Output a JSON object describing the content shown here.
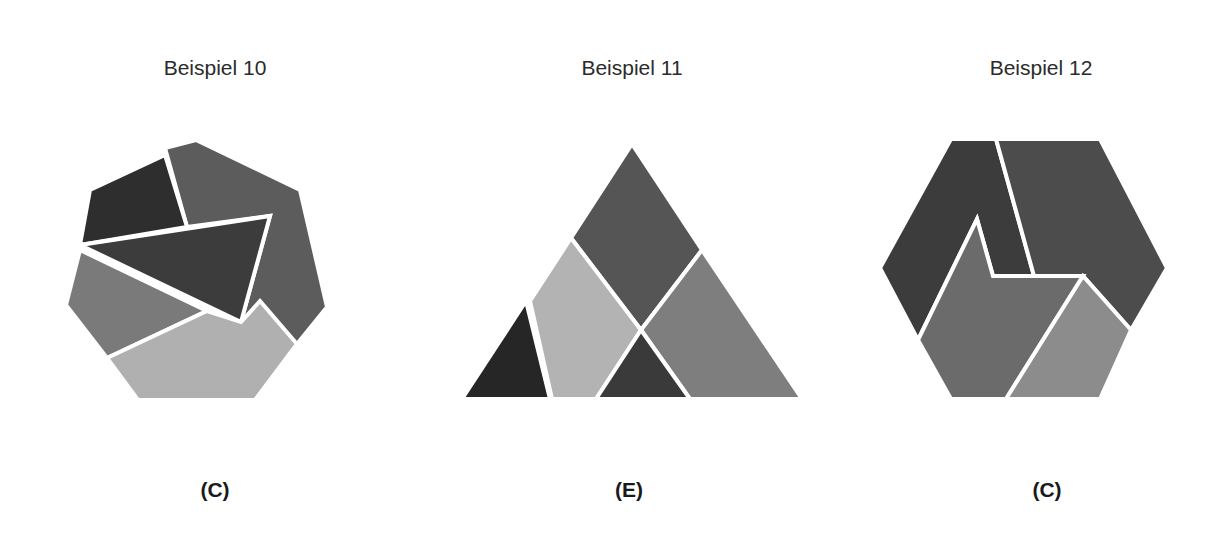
{
  "examples": [
    {
      "title": "Beispiel 10",
      "answer": "(C)",
      "shape": "heptagon"
    },
    {
      "title": "Beispiel 11",
      "answer": "(E)",
      "shape": "triangle"
    },
    {
      "title": "Beispiel 12",
      "answer": "(C)",
      "shape": "hexagon"
    }
  ],
  "colors": {
    "darkest": "#2e2e2e",
    "dark": "#4a4a4a",
    "mid": "#6e6e6e",
    "medium": "#878787",
    "light": "#b0b0b0",
    "separator": "#ffffff"
  }
}
